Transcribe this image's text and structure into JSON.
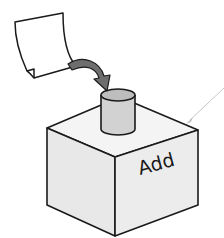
{
  "diagram": {
    "box_label": "Add",
    "elements": [
      {
        "name": "paper-sheet",
        "description": "curled sheet of paper"
      },
      {
        "name": "insert-arrow",
        "description": "curved dark gray arrow pointing from paper into cylinder slot"
      },
      {
        "name": "cylinder-slot",
        "description": "light gray cylinder on top of box"
      },
      {
        "name": "add-box",
        "description": "isometric box labeled Add"
      },
      {
        "name": "pointer-line",
        "description": "thin light gray leader line pointing at box label"
      }
    ],
    "colors": {
      "stroke": "#1a1a1a",
      "arrow_fill": "#6e6e6e",
      "cylinder_fill": "#cfcfcf",
      "cylinder_top": "#bdbdbd",
      "box_fill": "#ebebeb",
      "pointer": "#c8c8c8"
    }
  }
}
